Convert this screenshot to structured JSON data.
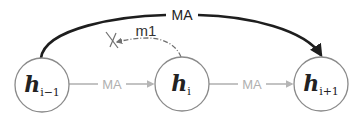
{
  "diagram": {
    "title": "",
    "nodes": [
      {
        "id": "h_i_minus_1",
        "base": "h",
        "sub": "i−1",
        "cx": 42,
        "cy": 85,
        "r": 27
      },
      {
        "id": "h_i",
        "base": "h",
        "sub": "i",
        "cx": 182,
        "cy": 84,
        "r": 27
      },
      {
        "id": "h_i_plus_1",
        "base": "h",
        "sub": "i+1",
        "cx": 321,
        "cy": 84,
        "r": 27
      }
    ],
    "edges": [
      {
        "from": "h_i_minus_1",
        "to": "h_i",
        "label": "MA",
        "style": "solid-gray"
      },
      {
        "from": "h_i",
        "to": "h_i_plus_1",
        "label": "MA",
        "style": "solid-gray"
      },
      {
        "from": "h_i_minus_1",
        "to": "h_i_plus_1",
        "label": "MA",
        "style": "solid-bold-dark-arc"
      },
      {
        "from": "h_i",
        "to": "blocked",
        "label": "m1",
        "style": "dash-dot-arc",
        "terminator": "cross-mark"
      }
    ],
    "labels": {
      "top_arc": "MA",
      "left_edge": "MA",
      "right_edge": "MA",
      "dashed_arc": "m1"
    },
    "colors": {
      "node_stroke": "#8a8a8a",
      "node_fill": "#ffffff",
      "gray_edge": "#b5b5b5",
      "dark_arc": "#1e1e1e",
      "dashed_arc": "#707070",
      "cross": "#707070"
    }
  }
}
